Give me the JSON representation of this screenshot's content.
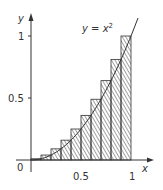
{
  "chart_data": {
    "type": "bar",
    "function_label": "y = x",
    "function_exponent": "2",
    "xlabel": "x",
    "ylabel": "y",
    "origin_label": "0",
    "x_ticks": [
      {
        "value": 0.5,
        "label": "0.5"
      },
      {
        "value": 1,
        "label": "1"
      }
    ],
    "y_ticks": [
      {
        "value": 0.5,
        "label": "0.5"
      },
      {
        "value": 1,
        "label": "1"
      }
    ],
    "xlim": [
      0,
      1.1
    ],
    "ylim": [
      0,
      1.1
    ],
    "grid": false,
    "categories": [
      "0.1",
      "0.2",
      "0.3",
      "0.4",
      "0.5",
      "0.6",
      "0.7",
      "0.8",
      "0.9",
      "1.0"
    ],
    "values": [
      0.01,
      0.04,
      0.09,
      0.16,
      0.25,
      0.36,
      0.49,
      0.64,
      0.81,
      1.0
    ],
    "curve": {
      "name": "y = x^2",
      "x_range": [
        0,
        1.02
      ]
    }
  },
  "colors": {
    "axis": "#333333",
    "hatch": "#444444",
    "curve": "#333333"
  }
}
